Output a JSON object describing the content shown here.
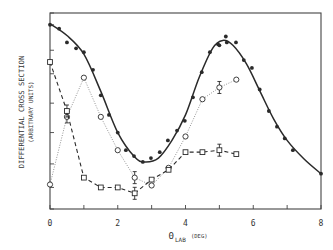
{
  "chart_data": {
    "type": "line",
    "title": "",
    "xlabel": "ΘLAB (DEG)",
    "xlabel_main": "Θ",
    "xlabel_sub": "LAB",
    "xlabel_unit": "(DEG)",
    "ylabel": "DIFFERENTIAL CROSS SECTION",
    "ylabel_sub": "(ARBITRARY UNITS)",
    "xlim": [
      0,
      8
    ],
    "ylim": [
      0,
      10
    ],
    "xticks": [
      0,
      1,
      2,
      3,
      4,
      5,
      6,
      7,
      8
    ],
    "xtick_labels": [
      "0",
      "2",
      "4",
      "6",
      "8"
    ],
    "xtick_label_values": [
      0,
      2,
      4,
      6,
      8
    ],
    "yticks": [
      0.0,
      1.1,
      2.3,
      3.9,
      5.4,
      6.9,
      8.1,
      9.4,
      10
    ],
    "ytick_labels": [],
    "grid": false,
    "legend": null,
    "series": [
      {
        "name": "filled circles (solid fit)",
        "marker": "filled-circle",
        "line": "solid",
        "x": [
          0.0,
          0.27,
          0.5,
          0.77,
          1.0,
          1.27,
          1.5,
          1.74,
          2.0,
          2.24,
          2.48,
          2.74,
          2.98,
          3.24,
          3.48,
          3.75,
          3.98,
          4.22,
          4.48,
          4.72,
          4.96,
          5.0,
          5.19,
          5.22,
          5.49,
          5.72,
          5.96,
          6.19,
          6.46,
          6.7,
          6.93,
          7.17,
          8.0
        ],
        "values": [
          9.4,
          9.2,
          8.5,
          8.2,
          8.0,
          7.1,
          5.8,
          4.8,
          3.9,
          3.0,
          2.7,
          2.4,
          2.6,
          2.9,
          3.5,
          4.0,
          4.5,
          5.7,
          6.98,
          8.0,
          8.4,
          8.35,
          8.8,
          8.5,
          8.5,
          7.6,
          7.2,
          6.1,
          5.0,
          4.2,
          3.6,
          3.0,
          1.8
        ]
      },
      {
        "name": "open circles (dotted)",
        "marker": "open-circle",
        "line": "dotted",
        "x": [
          0.0,
          0.5,
          1.0,
          1.5,
          2.0,
          2.5,
          3.0,
          3.5,
          4.0,
          4.5,
          5.0,
          5.5
        ],
        "values": [
          1.25,
          4.7,
          6.7,
          4.7,
          3.0,
          1.6,
          1.2,
          2.1,
          3.7,
          5.6,
          6.2,
          6.6
        ],
        "error_bars_at": [
          0.5,
          2.5,
          5.0
        ]
      },
      {
        "name": "open squares (dashed)",
        "marker": "open-square",
        "line": "dashed",
        "x": [
          0.0,
          0.5,
          1.0,
          1.5,
          2.0,
          2.5,
          3.0,
          3.5,
          4.0,
          4.5,
          5.0,
          5.5
        ],
        "values": [
          7.5,
          5.0,
          1.6,
          1.1,
          1.1,
          0.8,
          1.5,
          2.0,
          2.9,
          2.9,
          3.0,
          2.8
        ],
        "error_bars_at": [
          0.5,
          2.5,
          5.0
        ]
      }
    ]
  },
  "colors": {
    "ink": "#2a2a2a",
    "frame": "#444444",
    "dotted_line": "#888888",
    "background": "#ffffff"
  }
}
